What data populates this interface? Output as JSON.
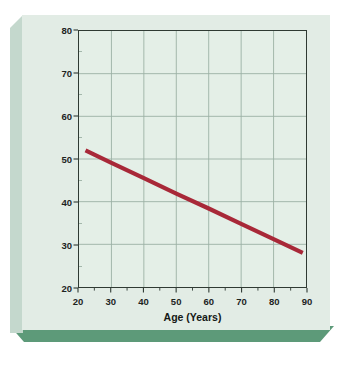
{
  "chart_data": {
    "type": "line",
    "title": "",
    "xlabel": "Age (Years)",
    "ylabel": "Work of the Heart LVSWI (g/m/m2)",
    "ylabel_main": "Work of the Heart LVSWI (g/m/m",
    "ylabel_sup": "2",
    "ylabel_close": ")",
    "xlim": [
      20,
      90
    ],
    "ylim": [
      20,
      80
    ],
    "xticks": [
      20,
      30,
      40,
      50,
      60,
      70,
      80,
      90
    ],
    "yticks": [
      20,
      30,
      40,
      50,
      60,
      70,
      80
    ],
    "xtick_labels": [
      "20",
      "30",
      "40",
      "50",
      "60",
      "70",
      "80",
      "90"
    ],
    "ytick_labels": [
      "20",
      "30",
      "40",
      "50",
      "60",
      "70",
      "80"
    ],
    "x_minor_step": 5,
    "y_minor_step": 5,
    "grid": true,
    "legend": "none",
    "series": [
      {
        "name": "Work of the Heart (LVSWI)",
        "color": "#a82838",
        "line_width": 4.2,
        "x": [
          22,
          89
        ],
        "values": [
          52,
          28
        ],
        "points": [
          [
            22,
            52
          ],
          [
            30,
            49.1
          ],
          [
            40,
            45.5
          ],
          [
            50,
            41.9
          ],
          [
            60,
            38.4
          ],
          [
            70,
            34.8
          ],
          [
            80,
            31.2
          ],
          [
            89,
            28
          ]
        ]
      }
    ]
  },
  "figure": {
    "panel_color": "#e2ece5",
    "plot_background": "#e4efe7",
    "bevel_color": "#c4d8cd",
    "shadow_color": "#5d9a79",
    "frame_color": "#2f3a33",
    "grid_color": "#9bb0a4",
    "line_color": "#a82838"
  }
}
